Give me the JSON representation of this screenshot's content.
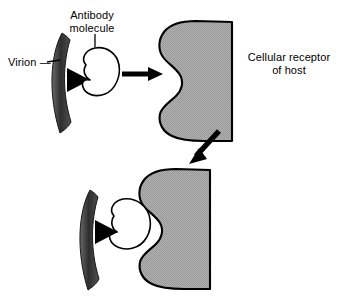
{
  "figure": {
    "width": 345,
    "height": 297,
    "background": "#ffffff"
  },
  "colors": {
    "outline": "#000000",
    "receptor_fill": "#a8a8a8",
    "virion_fill": "#3a3a3a",
    "spike_fill": "#000000",
    "antibody_fill": "#ffffff",
    "text": "#000000"
  },
  "labels": {
    "virion": "Virion —",
    "antibody": "Antibody\nmolecule",
    "receptor": "Cellular receptor\nof host"
  },
  "panels": {
    "top": {
      "name": "free-antibody-and-receptor",
      "elements": [
        "virion",
        "antibody-molecule",
        "cellular-receptor"
      ]
    },
    "bottom": {
      "name": "blocked-attachment",
      "elements": [
        "virion",
        "antibody-molecule",
        "cellular-receptor"
      ]
    }
  },
  "arrows": {
    "horizontal": {
      "name": "binding-arrow",
      "direction": "right"
    },
    "diagonal": {
      "name": "blocking-arrow",
      "direction": "down-left"
    }
  },
  "icons": {
    "virion": "virion-crescent-icon",
    "spike": "attachment-spike-icon",
    "antibody": "antibody-molecule-icon",
    "receptor": "cellular-receptor-icon"
  }
}
